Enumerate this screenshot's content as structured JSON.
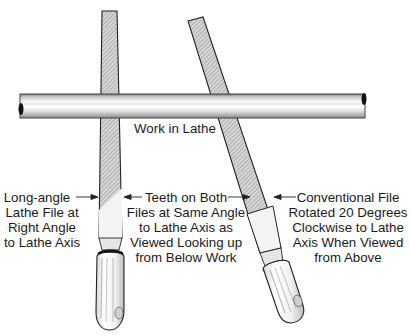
{
  "diagram": {
    "work_label": "Work in Lathe",
    "left_label": [
      "Long-angle",
      "Lathe File at",
      "Right Angle",
      "to Lathe Axis"
    ],
    "center_label": [
      "Teeth on Both",
      "Files at Same Angle",
      "to Lathe Axis as",
      "Viewed Looking up",
      "from Below Work"
    ],
    "right_label": [
      "Conventional File",
      "Rotated 20 Degrees",
      "Clockwise to Lathe",
      "Axis When Viewed",
      "from Above"
    ],
    "colors": {
      "outline": "#222222",
      "hatch": "#9a9a9a",
      "rod_light": "#f2f2f2",
      "rod_dark": "#8c8c8c"
    }
  }
}
